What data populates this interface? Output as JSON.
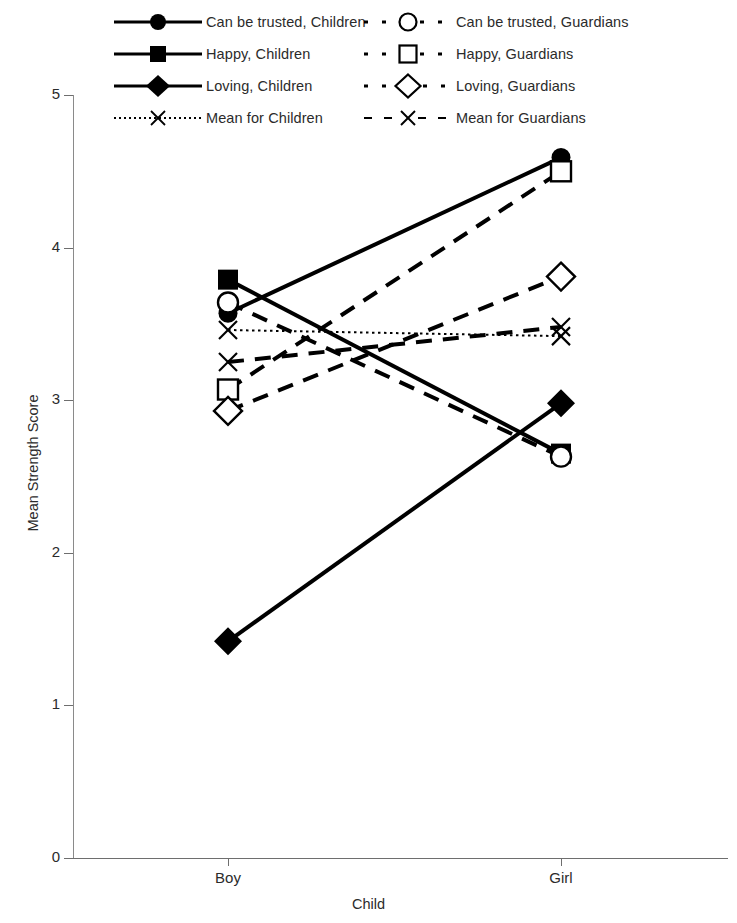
{
  "chart_data": {
    "type": "line",
    "title": "",
    "xlabel": "Child",
    "ylabel": "Mean Strength Score",
    "categories": [
      "Boy",
      "Girl"
    ],
    "x_tick_labels": [
      "Boy",
      "Girl"
    ],
    "y_tick_labels": [
      "0",
      "1",
      "2",
      "3",
      "4",
      "5"
    ],
    "y_ticks": [
      0,
      1,
      2,
      3,
      4,
      5
    ],
    "ylim": [
      0,
      5
    ],
    "grid": false,
    "legend_position": "top",
    "series": [
      {
        "name": "Can be trusted, Children",
        "marker": "filled-circle",
        "line_style": "solid",
        "group": "Children",
        "values": [
          3.57,
          4.59
        ]
      },
      {
        "name": "Happy, Children",
        "marker": "filled-square",
        "line_style": "solid",
        "group": "Children",
        "values": [
          3.79,
          2.65
        ]
      },
      {
        "name": "Loving, Children",
        "marker": "filled-diamond",
        "line_style": "solid",
        "group": "Children",
        "values": [
          1.42,
          2.98
        ]
      },
      {
        "name": "Mean for Children",
        "marker": "cross-x",
        "line_style": "dotted",
        "group": "Children",
        "values": [
          3.46,
          3.42
        ]
      },
      {
        "name": "Can be trusted, Guardians",
        "marker": "open-circle",
        "line_style": "dashed",
        "group": "Guardians",
        "values": [
          3.64,
          2.63
        ]
      },
      {
        "name": "Happy, Guardians",
        "marker": "open-square",
        "line_style": "dashed",
        "group": "Guardians",
        "values": [
          3.07,
          4.5
        ]
      },
      {
        "name": "Loving, Guardians",
        "marker": "open-diamond",
        "line_style": "dashed",
        "group": "Guardians",
        "values": [
          2.93,
          3.81
        ]
      },
      {
        "name": "Mean for Guardians",
        "marker": "cross-x",
        "line_style": "dashed",
        "group": "Guardians",
        "values": [
          3.25,
          3.48
        ]
      }
    ]
  },
  "legend": {
    "column_left": [
      {
        "label": "Can be trusted, Children",
        "icon": "filled-circle-solid-line-icon"
      },
      {
        "label": "Happy, Children",
        "icon": "filled-square-solid-line-icon"
      },
      {
        "label": "Loving, Children",
        "icon": "filled-diamond-solid-line-icon"
      },
      {
        "label": "Mean for Children",
        "icon": "cross-x-dotted-line-icon"
      }
    ],
    "column_right": [
      {
        "label": "Can be trusted, Guardians",
        "icon": "open-circle-dashed-line-icon"
      },
      {
        "label": "Happy, Guardians",
        "icon": "open-square-dashed-line-icon"
      },
      {
        "label": "Loving, Guardians",
        "icon": "open-diamond-dashed-line-icon"
      },
      {
        "label": "Mean for Guardians",
        "icon": "cross-x-dashed-line-icon"
      }
    ]
  },
  "colors": {
    "ink": "#000000",
    "axis": "#6e6e6e",
    "text": "#2b2b2b",
    "background": "#ffffff"
  }
}
